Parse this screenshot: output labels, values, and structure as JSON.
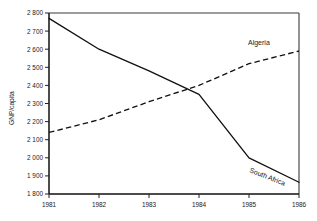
{
  "chart_data": {
    "type": "line",
    "title": "",
    "subtitle": "",
    "xlabel": "",
    "ylabel": "GNP/capita",
    "x": [
      1981,
      1982,
      1983,
      1984,
      1985,
      1986
    ],
    "xtick_labels": [
      "1981",
      "1982",
      "1983",
      "1984",
      "1985",
      "1986"
    ],
    "xlim": [
      1981,
      1986
    ],
    "ylim": [
      1800,
      2800
    ],
    "ytick_values": [
      1800,
      1900,
      2000,
      2100,
      2200,
      2300,
      2400,
      2500,
      2600,
      2700,
      2800
    ],
    "ytick_labels": [
      "1 800",
      "1 900",
      "2 000",
      "2 100",
      "2 200",
      "2 300",
      "2 400",
      "2 500",
      "2 600",
      "2 700",
      "2 800"
    ],
    "grid": false,
    "legend_position": "inline-annotation",
    "series": [
      {
        "name": "South Africa",
        "style": "solid",
        "color": "#111111",
        "values": [
          2770,
          2600,
          2480,
          2350,
          2000,
          1865
        ],
        "label_text": "South Africa"
      },
      {
        "name": "Algeria",
        "style": "dashed",
        "color": "#111111",
        "values": [
          2140,
          2210,
          2310,
          2400,
          2520,
          2590
        ],
        "label_text": "Algeria"
      }
    ],
    "annotations": [
      {
        "text": "Algeria",
        "x": 1985.0,
        "y": 2650
      },
      {
        "text": "South Africa",
        "x": 1985.2,
        "y": 1975
      }
    ]
  },
  "axes": {
    "y_axis_title": "GNP/capita"
  }
}
